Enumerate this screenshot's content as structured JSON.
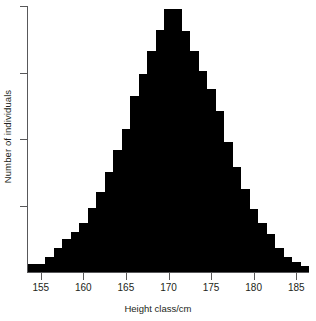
{
  "chart_data": {
    "type": "bar",
    "title": "",
    "subtitle": "",
    "xlabel": "Height class/cm",
    "ylabel": "Number of individuals",
    "xlim": [
      153.5,
      186.5
    ],
    "ylim": [
      0,
      1060
    ],
    "grid": false,
    "legend": null,
    "legend_position": "none",
    "bar_color": "#000000",
    "axis_color": "#58585a",
    "bin_width_cm": 1,
    "xtick_labels": [
      "155",
      "160",
      "165",
      "170",
      "175",
      "180",
      "185"
    ],
    "xticks": [
      155,
      160,
      165,
      170,
      175,
      180,
      185
    ],
    "ytick_labels": [
      "",
      "",
      "",
      ""
    ],
    "yticks": [
      265,
      530,
      795,
      1060
    ],
    "annotations": [],
    "categories": [
      154,
      155,
      156,
      157,
      158,
      159,
      160,
      161,
      162,
      163,
      164,
      165,
      166,
      167,
      168,
      169,
      170,
      171,
      172,
      173,
      174,
      175,
      176,
      177,
      178,
      179,
      180,
      181,
      182,
      183,
      184,
      185,
      186
    ],
    "values": [
      30,
      30,
      60,
      95,
      130,
      160,
      195,
      255,
      320,
      400,
      485,
      570,
      700,
      790,
      880,
      965,
      1050,
      1050,
      960,
      880,
      800,
      730,
      640,
      520,
      420,
      330,
      250,
      195,
      150,
      95,
      60,
      40,
      25
    ]
  },
  "figure": {
    "background": "#ffffff"
  }
}
